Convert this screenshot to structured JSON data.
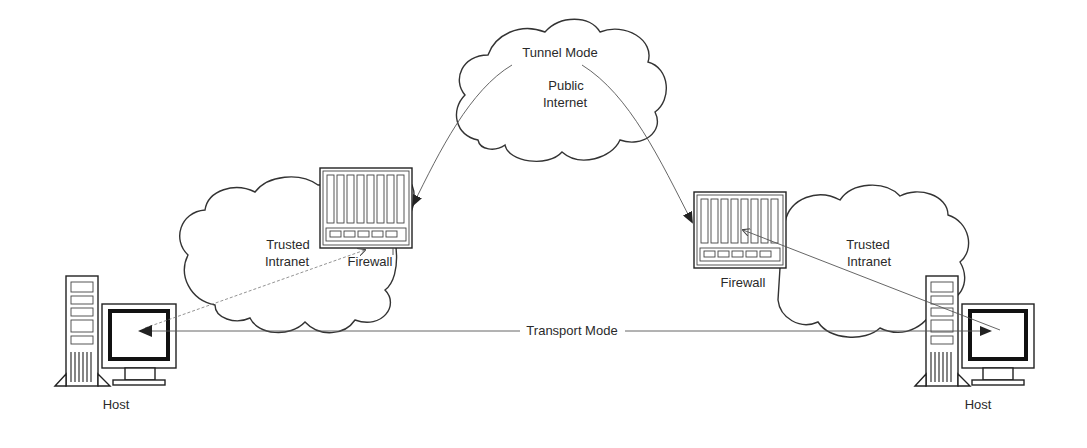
{
  "diagram": {
    "type": "network-topology",
    "colors": {
      "background": "#ffffff",
      "stroke": "#333333",
      "text": "#2a2a2a"
    },
    "clouds": [
      {
        "id": "public",
        "labels": [
          "Public",
          "Internet"
        ]
      },
      {
        "id": "left-intranet",
        "labels": [
          "Trusted",
          "Intranet"
        ]
      },
      {
        "id": "right-intranet",
        "labels": [
          "Trusted",
          "Intranet"
        ]
      }
    ],
    "nodes": [
      {
        "id": "left-host",
        "label": "Host",
        "icon": "desktop-computer-icon"
      },
      {
        "id": "left-firewall",
        "label": "Firewall",
        "icon": "firewall-rack-icon"
      },
      {
        "id": "right-firewall",
        "label": "Firewall",
        "icon": "firewall-rack-icon"
      },
      {
        "id": "right-host",
        "label": "Host",
        "icon": "desktop-computer-icon"
      }
    ],
    "connections": [
      {
        "label": "Tunnel Mode",
        "from": "left-firewall",
        "to": "right-firewall",
        "via": "public"
      },
      {
        "label": "Transport Mode",
        "from": "left-host",
        "to": "right-host"
      },
      {
        "label": "",
        "from": "left-host",
        "to": "left-firewall"
      },
      {
        "label": "",
        "from": "right-firewall",
        "to": "right-host"
      }
    ]
  },
  "labels": {
    "tunnel_mode": "Tunnel Mode",
    "public": "Public",
    "internet": "Internet",
    "trusted_left": "Trusted",
    "intranet_left": "Intranet",
    "trusted_right": "Trusted",
    "intranet_right": "Intranet",
    "firewall_left": "Firewall",
    "firewall_right": "Firewall",
    "transport_mode": "Transport Mode",
    "host_left": "Host",
    "host_right": "Host"
  }
}
